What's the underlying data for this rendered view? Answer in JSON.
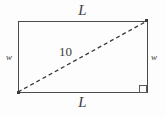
{
  "figure": {
    "shape": "rectangle",
    "background_color": "#fdfdfd",
    "stroke_color": "#4a4a4a",
    "text_color": "#3c3c3c",
    "rect": {
      "x": 18,
      "y": 21,
      "width": 130,
      "height": 72
    },
    "diagonal": {
      "name": "diagonal",
      "style": "dashed",
      "from_x": 18,
      "from_y": 92,
      "to_x": 147,
      "to_y": 21,
      "dash_pattern": "4 3",
      "color": "#3a3a3a"
    },
    "right_angle_marker": {
      "x": 139,
      "y": 85,
      "size": 8
    },
    "labels": {
      "length_top": "L",
      "length_bottom": "L",
      "width_left": "w",
      "width_right": "w",
      "diagonal_value": "10"
    }
  }
}
